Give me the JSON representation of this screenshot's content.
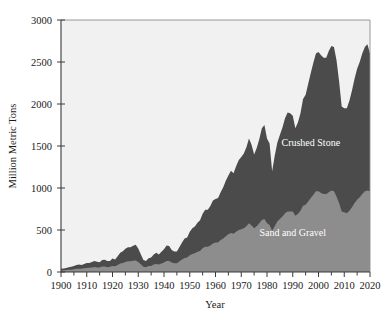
{
  "chart_data": {
    "type": "area",
    "stacked": true,
    "title": "",
    "subtitle": "",
    "xlabel": "Year",
    "ylabel": "Million Metric Tons",
    "xlim": [
      1900,
      2020
    ],
    "ylim": [
      0,
      3000
    ],
    "xticks": [
      1900,
      1910,
      1920,
      1930,
      1940,
      1950,
      1960,
      1970,
      1980,
      1990,
      2000,
      2010,
      2020
    ],
    "xtick_labels": [
      "1900",
      "1910",
      "1920",
      "1930",
      "1940",
      "1950",
      "1960",
      "1970",
      "1980",
      "1990",
      "2000",
      "2010",
      "2020"
    ],
    "xminor_step": 5,
    "yticks": [
      0,
      500,
      1000,
      1500,
      2000,
      2500,
      3000
    ],
    "ytick_labels": [
      "0",
      "500",
      "1000",
      "1500",
      "2000",
      "2500",
      "3000"
    ],
    "grid": false,
    "legend_position": "inline-annotations",
    "plot_background": "#f1f1f1",
    "colors": {
      "sand_and_gravel": "#8d8d8d",
      "crushed_stone": "#4b4b4b",
      "plot_background": "#f1f1f1",
      "axis": "#3a3a3a",
      "text": "#1a1a1a",
      "annotation_text": "#ffffff"
    },
    "annotations": [
      {
        "text": "Crushed Stone",
        "x": 1997,
        "y": 1500
      },
      {
        "text": "Sand and Gravel",
        "x": 1990,
        "y": 430
      }
    ],
    "x": [
      1900,
      1901,
      1902,
      1903,
      1904,
      1905,
      1906,
      1907,
      1908,
      1909,
      1910,
      1911,
      1912,
      1913,
      1914,
      1915,
      1916,
      1917,
      1918,
      1919,
      1920,
      1921,
      1922,
      1923,
      1924,
      1925,
      1926,
      1927,
      1928,
      1929,
      1930,
      1931,
      1932,
      1933,
      1934,
      1935,
      1936,
      1937,
      1938,
      1939,
      1940,
      1941,
      1942,
      1943,
      1944,
      1945,
      1946,
      1947,
      1948,
      1949,
      1950,
      1951,
      1952,
      1953,
      1954,
      1955,
      1956,
      1957,
      1958,
      1959,
      1960,
      1961,
      1962,
      1963,
      1964,
      1965,
      1966,
      1967,
      1968,
      1969,
      1970,
      1971,
      1972,
      1973,
      1974,
      1975,
      1976,
      1977,
      1978,
      1979,
      1980,
      1981,
      1982,
      1983,
      1984,
      1985,
      1986,
      1987,
      1988,
      1989,
      1990,
      1991,
      1992,
      1993,
      1994,
      1995,
      1996,
      1997,
      1998,
      1999,
      2000,
      2001,
      2002,
      2003,
      2004,
      2005,
      2006,
      2007,
      2008,
      2009,
      2010,
      2011,
      2012,
      2013,
      2014,
      2015,
      2016,
      2017,
      2018,
      2019,
      2020
    ],
    "series": [
      {
        "name": "Sand and Gravel",
        "color": "#8d8d8d",
        "values": [
          18,
          20,
          23,
          26,
          28,
          33,
          38,
          40,
          38,
          44,
          48,
          50,
          55,
          60,
          55,
          55,
          65,
          65,
          58,
          62,
          72,
          68,
          82,
          100,
          108,
          118,
          128,
          128,
          135,
          138,
          120,
          92,
          62,
          58,
          70,
          72,
          88,
          95,
          88,
          100,
          112,
          130,
          130,
          112,
          105,
          105,
          128,
          150,
          168,
          172,
          200,
          215,
          222,
          240,
          250,
          282,
          300,
          300,
          315,
          340,
          350,
          352,
          380,
          400,
          425,
          450,
          465,
          455,
          480,
          500,
          510,
          520,
          545,
          580,
          555,
          520,
          545,
          580,
          620,
          630,
          580,
          560,
          490,
          545,
          600,
          630,
          660,
          700,
          720,
          720,
          720,
          670,
          690,
          730,
          790,
          800,
          840,
          880,
          920,
          960,
          960,
          940,
          930,
          930,
          950,
          970,
          960,
          900,
          820,
          720,
          710,
          700,
          730,
          770,
          820,
          860,
          890,
          930,
          960,
          970,
          960
        ]
      },
      {
        "name": "Crushed Stone",
        "color": "#4b4b4b",
        "values": [
          20,
          22,
          26,
          30,
          34,
          38,
          44,
          48,
          44,
          50,
          58,
          58,
          64,
          72,
          66,
          62,
          78,
          80,
          72,
          70,
          90,
          82,
          105,
          130,
          140,
          158,
          168,
          168,
          178,
          185,
          160,
          120,
          80,
          72,
          95,
          100,
          120,
          135,
          120,
          140,
          160,
          185,
          180,
          150,
          140,
          138,
          170,
          200,
          230,
          240,
          280,
          305,
          320,
          345,
          365,
          410,
          440,
          440,
          470,
          510,
          520,
          530,
          570,
          610,
          660,
          700,
          740,
          720,
          780,
          830,
          860,
          890,
          940,
          1010,
          960,
          880,
          930,
          1000,
          1090,
          1120,
          1010,
          970,
          710,
          840,
          940,
          1000,
          1060,
          1130,
          1180,
          1170,
          1140,
          1040,
          1090,
          1160,
          1270,
          1310,
          1400,
          1490,
          1570,
          1640,
          1660,
          1640,
          1620,
          1620,
          1680,
          1720,
          1720,
          1620,
          1450,
          1250,
          1240,
          1250,
          1310,
          1390,
          1480,
          1560,
          1610,
          1670,
          1720,
          1740,
          1640
        ]
      }
    ]
  },
  "axes": {
    "y_title": "Million Metric Tons",
    "x_title": "Year"
  }
}
